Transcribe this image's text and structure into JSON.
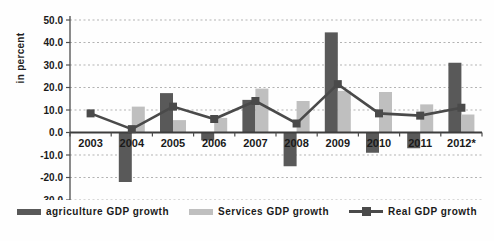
{
  "chart_data": {
    "type": "bar",
    "subtype": "bar-line-combo",
    "title": "",
    "ylabel": "in percent",
    "xlabel": "",
    "ylim": [
      -30,
      50
    ],
    "ytick_step": 10,
    "ytick_format_decimals": 1,
    "grid": "horizontal-dashed",
    "legend_position": "bottom",
    "categories": [
      "2003",
      "2004",
      "2005",
      "2006",
      "2007",
      "2008",
      "2009",
      "2010",
      "2011",
      "2012*"
    ],
    "series": [
      {
        "name": "agriculture GDP growth",
        "render": "bar",
        "color": "#595959",
        "values": [
          null,
          -22,
          17.5,
          -3.5,
          14.5,
          -15,
          44.5,
          -9,
          -7,
          31
        ]
      },
      {
        "name": "Services GDP growth",
        "render": "bar",
        "color": "#bfbfbf",
        "values": [
          null,
          11.5,
          5.5,
          6.5,
          19.5,
          14,
          18.5,
          18,
          12.5,
          8
        ]
      },
      {
        "name": "Real GDP growth",
        "render": "line",
        "marker": "square",
        "color": "#4a4a4a",
        "values": [
          8.5,
          1.5,
          11.5,
          6,
          14,
          4,
          21.5,
          8.5,
          7.5,
          11
        ]
      }
    ],
    "colors": {
      "gridline": "#b3b3b3",
      "axis": "#4d4d4d",
      "text": "#1a1a1a",
      "background": "#fefefe"
    }
  }
}
